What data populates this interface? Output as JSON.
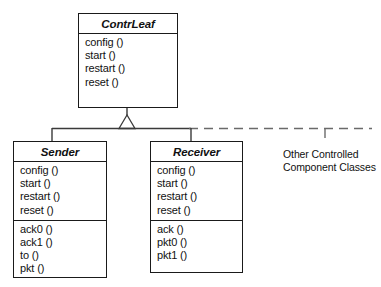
{
  "diagram": {
    "type": "uml-class-diagram",
    "relationship": "generalization",
    "classes": [
      {
        "id": "contrleaf",
        "name": "ContrLeaf",
        "abstract": true,
        "compartments": [
          [
            "config ()",
            "start ()",
            "restart ()",
            "reset ()"
          ]
        ],
        "box": {
          "x": 78,
          "y": 13,
          "width": 100,
          "height": 95
        },
        "title_height": 20
      },
      {
        "id": "sender",
        "name": "Sender",
        "abstract": true,
        "compartments": [
          [
            "config ()",
            "start ()",
            "restart ()",
            "reset ()"
          ],
          [
            "ack0 ()",
            "ack1 ()",
            "to ()",
            "pkt ()"
          ]
        ],
        "box": {
          "x": 13,
          "y": 141,
          "width": 94,
          "height": 137
        },
        "title_height": 20
      },
      {
        "id": "receiver",
        "name": "Receiver",
        "abstract": true,
        "compartments": [
          [
            "config ()",
            "start ()",
            "restart ()",
            "reset ()"
          ],
          [
            "ack ()",
            "pkt0 ()",
            "pkt1 ()"
          ]
        ],
        "box": {
          "x": 150,
          "y": 141,
          "width": 93,
          "height": 132
        },
        "title_height": 20
      }
    ],
    "annotations": [
      {
        "id": "other-classes-note",
        "lines": [
          "Other Controlled",
          "Component Classes"
        ],
        "x": 283,
        "y": 148
      }
    ],
    "connectors": {
      "parent_stem": {
        "x": 127,
        "y_from": 108,
        "y_to": 117
      },
      "generalization_triangle": {
        "apex_x": 127,
        "apex_y": 116,
        "base_y": 128,
        "half_width": 8
      },
      "crossbar": {
        "y": 128,
        "x_from": 52,
        "x_to": 191
      },
      "dashed_extension": {
        "y": 128,
        "x_from": 191,
        "x_to": 370
      },
      "drop_sender": {
        "x": 52,
        "y_from": 128,
        "y_to": 141
      },
      "drop_receiver": {
        "x": 191,
        "y_from": 128,
        "y_to": 141
      },
      "drop_other_dashed": {
        "x": 325,
        "y_from": 128,
        "y_to": 143
      }
    },
    "colors": {
      "stroke": "#1a1a1a",
      "connector": "#3a3a3a",
      "text": "#111111",
      "background": "#ffffff"
    }
  }
}
